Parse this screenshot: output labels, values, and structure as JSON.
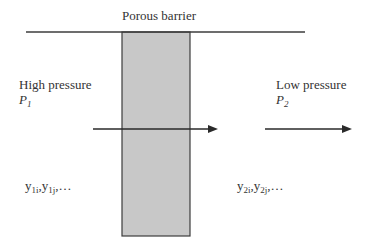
{
  "title": "Porous barrier",
  "left": {
    "label": "High pressure",
    "pressure_symbol": "P",
    "pressure_subscript": "1",
    "composition": {
      "base1": "y",
      "sub1": "1i",
      "sep": ",",
      "base2": "y",
      "sub2": "1j",
      "tail": ",…"
    }
  },
  "right": {
    "label": "Low pressure",
    "pressure_symbol": "P",
    "pressure_subscript": "2",
    "composition": {
      "base1": "y",
      "sub1": "2i",
      "sep": ",",
      "base2": "y",
      "sub2": "2j",
      "tail": ",…"
    }
  },
  "colors": {
    "barrier_fill": "#c8c8c8",
    "line": "#3c3c3c"
  }
}
